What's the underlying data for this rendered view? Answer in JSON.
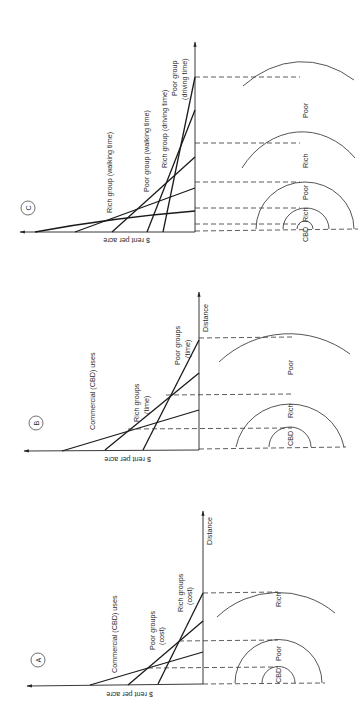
{
  "figure": {
    "axis_labels": {
      "rent": "$ rent per acre",
      "distance": "Distance"
    },
    "panels": [
      {
        "id": "C",
        "letter": "C",
        "bid_rent_curves": [
          "Rich group (walking time)",
          "Poor group (walking time)",
          "Rich group (driving time)",
          "Poor group",
          "(driving time)"
        ],
        "zones": [
          "CBD",
          "Rich",
          "Poor",
          "Rich",
          "Poor"
        ]
      },
      {
        "id": "B",
        "letter": "B",
        "bid_rent_curves": [
          "Commercial (CBD) uses",
          "Rich groups",
          "(time)",
          "Poor groups",
          "(time)"
        ],
        "zones": [
          "CBD",
          "Rich",
          "Poor"
        ]
      },
      {
        "id": "A",
        "letter": "A",
        "bid_rent_curves": [
          "Commercial (CBD) uses",
          "Poor groups",
          "(cost)",
          "Rich groups",
          "(cost)"
        ],
        "zones": [
          "CBD",
          "Poor",
          "Rich"
        ]
      }
    ]
  }
}
